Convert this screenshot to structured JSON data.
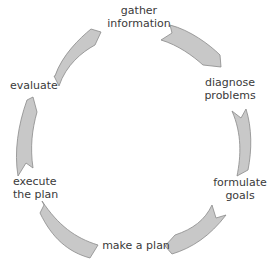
{
  "diagram": {
    "type": "cycle",
    "colors": {
      "arrow_fill": "#c8c8c8",
      "arrow_stroke": "#8a8a8a",
      "text": "#3a3a3a",
      "background": "#ffffff"
    },
    "steps": [
      {
        "line1": "gather",
        "line2": "information"
      },
      {
        "line1": "diagnose",
        "line2": "problems"
      },
      {
        "line1": "formulate",
        "line2": "goals"
      },
      {
        "line1": "make a plan",
        "line2": ""
      },
      {
        "line1": "execute",
        "line2": "the plan"
      },
      {
        "line1": "evaluate",
        "line2": ""
      }
    ]
  }
}
